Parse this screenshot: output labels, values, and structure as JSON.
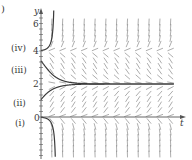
{
  "figure": {
    "panel_label_fragment": ")",
    "ode_description": "slope field for dy/dt with equilibria at y=0, y=2, y=4",
    "axes": {
      "x_label": "t",
      "y_label": "y",
      "y_ticks": [
        {
          "value": 0,
          "label": "0"
        },
        {
          "value": 2,
          "label": "2"
        },
        {
          "value": 4,
          "label": "4"
        },
        {
          "value": 6,
          "label": "6"
        }
      ]
    },
    "solution_labels": [
      {
        "id": "i",
        "label": "(i)",
        "initial_y": 0
      },
      {
        "id": "ii",
        "label": "(ii)",
        "initial_y": 1
      },
      {
        "id": "iii",
        "label": "(iii)",
        "initial_y": 3.4
      },
      {
        "id": "iv",
        "label": "(iv)",
        "initial_y": 4
      }
    ],
    "colors": {
      "axis": "#555555",
      "slope_marks": "#8a8a8a",
      "curves": "#3a3a3a",
      "text": "#3a3a3a"
    }
  }
}
